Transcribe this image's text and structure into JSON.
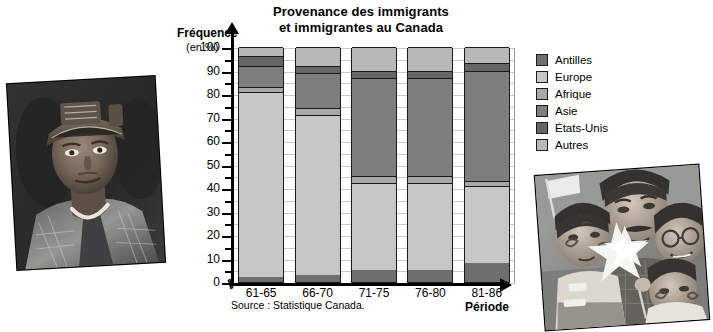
{
  "title": {
    "line1": "Provenance des immigrants",
    "line2": "et immigrantes au Canada"
  },
  "axes": {
    "y_label_main": "Fréquence",
    "y_label_sub": "(en %)",
    "x_label": "Période"
  },
  "source": "Source : Statistique Canada.",
  "legend": {
    "items": [
      {
        "label": "Antilles",
        "color": "#6e6e6e"
      },
      {
        "label": "Europe",
        "color": "#c7c7c7"
      },
      {
        "label": "Afrique",
        "color": "#a8a8a8"
      },
      {
        "label": "Asie",
        "color": "#7e7e7e"
      },
      {
        "label": "États-Unis",
        "color": "#656565"
      },
      {
        "label": "Autres",
        "color": "#b8b8b8"
      }
    ]
  },
  "photos": {
    "left": {
      "caption": "Photographie en noir et blanc d'un homme portant un couvre-chef traditionnel"
    },
    "right": {
      "caption": "Photographie en noir et blanc d'une famille avec enfants, visages peints et étoiles blanches"
    }
  },
  "chart_data": {
    "type": "bar",
    "subtype": "stacked-100",
    "title": "Provenance des immigrants et immigrantes au Canada",
    "xlabel": "Période",
    "ylabel": "Fréquence (en %)",
    "ylim": [
      0,
      100
    ],
    "yticks": [
      0,
      10,
      20,
      30,
      40,
      50,
      60,
      70,
      80,
      90,
      100
    ],
    "yticks_minor_step": 5,
    "grid": true,
    "legend_position": "right",
    "categories": [
      "61-65",
      "66-70",
      "71-75",
      "76-80",
      "81-86"
    ],
    "series": [
      {
        "name": "Antilles",
        "color": "#6e6e6e",
        "values": [
          2,
          3,
          5,
          5,
          8
        ]
      },
      {
        "name": "Europe",
        "color": "#c7c7c7",
        "values": [
          79,
          68,
          37,
          37,
          33
        ]
      },
      {
        "name": "Afrique",
        "color": "#a8a8a8",
        "values": [
          2,
          3,
          3,
          3,
          2
        ]
      },
      {
        "name": "Asie",
        "color": "#7e7e7e",
        "values": [
          9,
          15,
          42,
          42,
          47
        ]
      },
      {
        "name": "États-Unis",
        "color": "#656565",
        "values": [
          4,
          3,
          3,
          3,
          3
        ]
      },
      {
        "name": "Autres",
        "color": "#b8b8b8",
        "values": [
          4,
          8,
          10,
          10,
          7
        ]
      }
    ],
    "cumulative_tops": {
      "61-65": {
        "Antilles": 2,
        "Europe": 81,
        "Afrique": 83,
        "Asie": 92,
        "États-Unis": 96,
        "Autres": 100
      },
      "66-70": {
        "Antilles": 3,
        "Europe": 71,
        "Afrique": 74,
        "Asie": 89,
        "États-Unis": 92,
        "Autres": 100
      },
      "71-75": {
        "Antilles": 5,
        "Europe": 42,
        "Afrique": 45,
        "Asie": 87,
        "États-Unis": 90,
        "Autres": 100
      },
      "76-80": {
        "Antilles": 5,
        "Europe": 42,
        "Afrique": 45,
        "Asie": 87,
        "États-Unis": 90,
        "Autres": 100
      },
      "81-86": {
        "Antilles": 8,
        "Europe": 41,
        "Afrique": 43,
        "Asie": 90,
        "États-Unis": 93,
        "Autres": 100
      }
    }
  }
}
